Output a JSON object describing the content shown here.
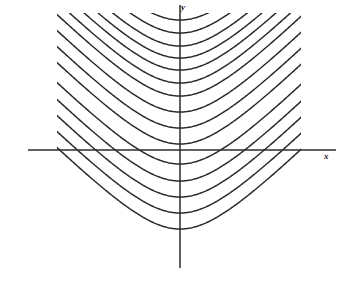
{
  "figure": {
    "title": "",
    "axis_labels": {
      "x": "x",
      "y": "y"
    },
    "colors": {
      "background": "#ffffff",
      "curve": "#2b2b2b",
      "axis": "#2b2b2b",
      "label": "#1a1a1a"
    }
  },
  "chart_data": {
    "type": "line",
    "title": "",
    "subtitle": "",
    "xlabel": "x",
    "ylabel": "y",
    "grid": false,
    "legend": null,
    "axes": {
      "x_axis": {
        "label": "x",
        "pixel_y": 150,
        "pixel_x_start": 28,
        "pixel_x_end": 336,
        "ticks": [],
        "tick_labels": []
      },
      "y_axis": {
        "label": "y",
        "pixel_x": 180,
        "pixel_y_start": 5,
        "pixel_y_end": 268,
        "ticks": [],
        "tick_labels": []
      },
      "origin": {
        "x": 180,
        "y": 150
      },
      "xlim": [
        -2.6,
        2.7
      ],
      "ylim": [
        -2.4,
        2.4
      ]
    },
    "clip_region": {
      "left": 57,
      "right": 301,
      "top": 13,
      "bottom": 249
    },
    "curve_family": {
      "equation": "y = c + sqrt(1 + x^2)",
      "asymptote_slope": 1.0,
      "units_per_pixel_x": 0.0192,
      "units_per_pixel_y": 0.0192,
      "count": 15
    },
    "series": [
      {
        "name": "curve-1",
        "vertex_y_pixel": 20,
        "vertex_y_value": 2.5
      },
      {
        "name": "curve-2",
        "vertex_y_pixel": 33,
        "vertex_y_value": 2.25
      },
      {
        "name": "curve-3",
        "vertex_y_pixel": 46,
        "vertex_y_value": 2.0
      },
      {
        "name": "curve-4",
        "vertex_y_pixel": 58,
        "vertex_y_value": 1.77
      },
      {
        "name": "curve-5",
        "vertex_y_pixel": 70,
        "vertex_y_value": 1.54
      },
      {
        "name": "curve-6",
        "vertex_y_pixel": 83,
        "vertex_y_value": 1.29
      },
      {
        "name": "curve-7",
        "vertex_y_pixel": 96,
        "vertex_y_value": 1.04
      },
      {
        "name": "curve-8",
        "vertex_y_pixel": 112,
        "vertex_y_value": 0.73
      },
      {
        "name": "curve-9",
        "vertex_y_pixel": 128,
        "vertex_y_value": 0.42
      },
      {
        "name": "curve-10",
        "vertex_y_pixel": 144,
        "vertex_y_value": 0.12
      },
      {
        "name": "curve-11",
        "vertex_y_pixel": 164,
        "vertex_y_value": -0.27
      },
      {
        "name": "curve-12",
        "vertex_y_pixel": 181,
        "vertex_y_value": -0.6
      },
      {
        "name": "curve-13",
        "vertex_y_pixel": 197,
        "vertex_y_value": -0.9
      },
      {
        "name": "curve-14",
        "vertex_y_pixel": 213,
        "vertex_y_value": -1.21
      },
      {
        "name": "curve-15",
        "vertex_y_pixel": 229,
        "vertex_y_value": -1.52
      }
    ],
    "annotations": []
  }
}
